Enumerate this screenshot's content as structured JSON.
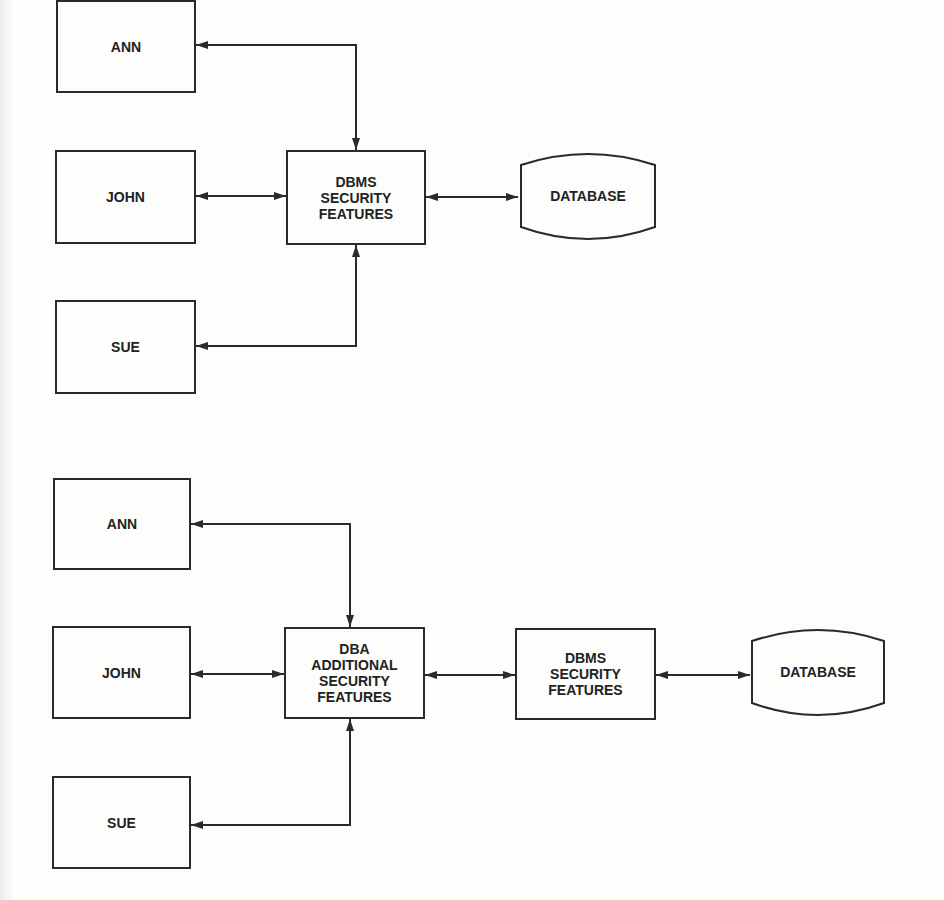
{
  "diagrams": [
    {
      "users": [
        "ANN",
        "JOHN",
        "SUE"
      ],
      "security_layer": {
        "lines": [
          "DBMS",
          "SECURITY",
          "FEATURES"
        ]
      },
      "database": {
        "label": "DATABASE"
      }
    },
    {
      "users": [
        "ANN",
        "JOHN",
        "SUE"
      ],
      "dba_layer": {
        "lines": [
          "DBA",
          "ADDITIONAL",
          "SECURITY",
          "FEATURES"
        ]
      },
      "security_layer": {
        "lines": [
          "DBMS",
          "SECURITY",
          "FEATURES"
        ]
      },
      "database": {
        "label": "DATABASE"
      }
    }
  ],
  "colors": {
    "line": "#2a2a2a",
    "background": "#fdfdfc",
    "text": "#222222"
  }
}
